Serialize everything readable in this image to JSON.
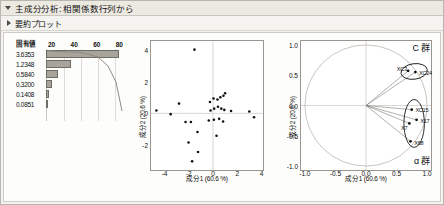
{
  "window": {
    "header_primary": "主成分分析: 相関係数行列から",
    "header_secondary": "要約プロット",
    "disclosure_open_icon": "triangle-down-icon",
    "disclosure_closed_icon": "triangle-right-icon"
  },
  "scree": {
    "value_column_header": "固有値",
    "axis_ticks": [
      "20",
      "40",
      "60",
      "80"
    ],
    "eigenvalues": [
      "3.6353",
      "1.2348",
      "0.5840",
      "0.3200",
      "0.1408",
      "0.0851"
    ],
    "bar_percents": [
      100,
      34,
      16,
      9,
      4,
      2
    ],
    "bar_fill": "#a8a49c",
    "bar_stroke": "#6f6c66"
  },
  "chart_data": [
    {
      "type": "scatter",
      "name": "score-plot",
      "title": "",
      "xlabel": "成分1 (60.6 %)",
      "ylabel": "成分2 (20.6 %)",
      "xlim": [
        -5.2,
        4.2
      ],
      "ylim": [
        -3.6,
        4.6
      ],
      "xticks": [
        -4,
        -2,
        0,
        2,
        4
      ],
      "yticks": [
        -2,
        0,
        2,
        4
      ],
      "grid": false,
      "points": [
        [
          -1.55,
          4.05
        ],
        [
          -2.85,
          0.62
        ],
        [
          -4.75,
          0.18
        ],
        [
          -3.55,
          -0.05
        ],
        [
          -2.3,
          -0.55
        ],
        [
          -1.85,
          -0.55
        ],
        [
          -1.3,
          -1.18
        ],
        [
          -2.05,
          -1.85
        ],
        [
          -1.25,
          -2.45
        ],
        [
          -1.75,
          -3.05
        ],
        [
          -0.25,
          0.72
        ],
        [
          0.05,
          0.95
        ],
        [
          0.38,
          0.88
        ],
        [
          0.62,
          1.02
        ],
        [
          0.88,
          1.12
        ],
        [
          1.02,
          1.28
        ],
        [
          -0.2,
          0.18
        ],
        [
          0.1,
          0.3
        ],
        [
          0.42,
          0.42
        ],
        [
          0.7,
          0.3
        ],
        [
          0.95,
          0.22
        ],
        [
          1.52,
          0.15
        ],
        [
          3.05,
          0.12
        ],
        [
          3.45,
          -0.25
        ],
        [
          -0.35,
          -0.45
        ],
        [
          0.08,
          -0.4
        ],
        [
          0.52,
          -0.35
        ],
        [
          0.85,
          -0.52
        ],
        [
          0.3,
          -1.42
        ]
      ]
    },
    {
      "type": "scatter",
      "name": "loading-plot",
      "title": "",
      "xlabel": "成分1 (60.6 %)",
      "ylabel": "成分2 (20.6 %)",
      "xlim": [
        -1.08,
        1.08
      ],
      "ylim": [
        -1.08,
        1.08
      ],
      "xticks": [
        "-1.0",
        "-0.5",
        "0.0",
        "0.5",
        "1.0"
      ],
      "yticks": [
        "-1.0",
        "-0.5",
        "0.0",
        "0.5",
        "1.0"
      ],
      "unit_circle": true,
      "grid": false,
      "vectors": [
        {
          "label": "XC3",
          "x": 0.7,
          "y": 0.58
        },
        {
          "label": "XC24",
          "x": 0.82,
          "y": 0.56
        },
        {
          "label": "XC15",
          "x": 0.76,
          "y": -0.07
        },
        {
          "label": "X17",
          "x": 0.84,
          "y": -0.24
        },
        {
          "label": "X7",
          "x": 0.72,
          "y": -0.3
        },
        {
          "label": "X68",
          "x": 0.74,
          "y": -0.6
        }
      ],
      "clusters": [
        {
          "label": "C 群",
          "cx": 0.8,
          "cy": 0.57,
          "rx": 0.22,
          "ry": 0.13,
          "rot": -8
        },
        {
          "label": "α 群",
          "cx": 0.8,
          "cy": -0.3,
          "rx": 0.17,
          "ry": 0.4,
          "rot": 0
        }
      ],
      "annotations": [
        {
          "text": "C 群",
          "position": "top-right"
        },
        {
          "text": "α 群",
          "position": "bottom-right"
        }
      ]
    }
  ]
}
